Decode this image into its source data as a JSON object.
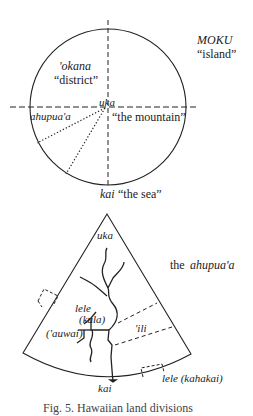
{
  "top_diagram": {
    "title": "MOKU",
    "title_gloss": "“island”",
    "okana": "'okana",
    "okana_gloss": "“district”",
    "uka": "uka",
    "ahupuaa": "ahupua'a",
    "mountain_gloss": "“the mountain”",
    "kai": "kai",
    "sea_gloss": "“the sea”"
  },
  "bottom_diagram": {
    "title_prefix": "the",
    "title": "ahupua'a",
    "uka": "uka",
    "lele": "lele",
    "kula": "(kula)",
    "auwai": "('auwai)",
    "ili": "'ili",
    "kai": "kai",
    "lele_kahakai": "lele (kahakai)"
  },
  "caption": "Fig. 5. Hawaiian land divisions"
}
